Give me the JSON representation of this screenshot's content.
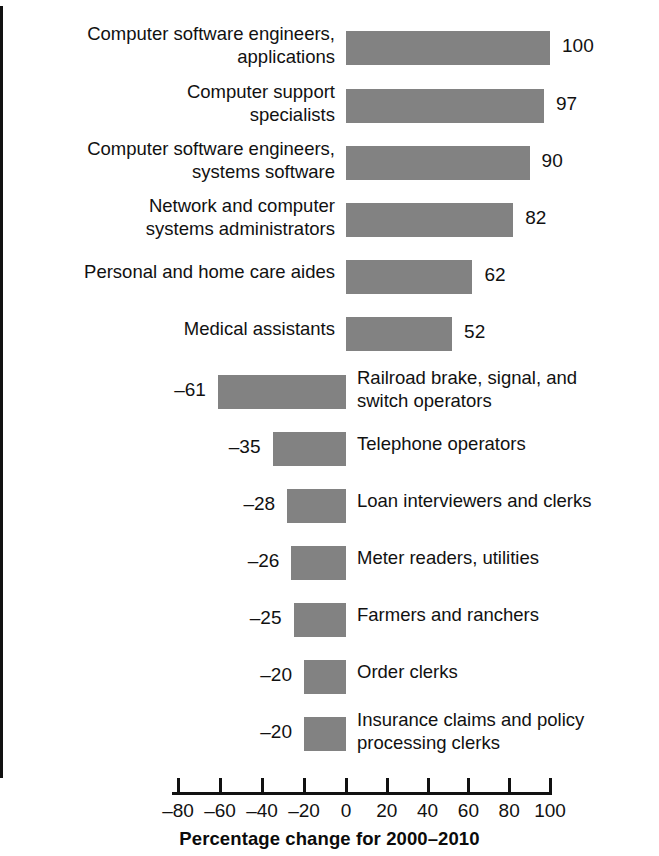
{
  "chart_data": {
    "type": "bar",
    "orientation": "horizontal",
    "title": "",
    "xlabel": "Percentage change for 2000–2010",
    "ylabel": "",
    "xlim": [
      -80,
      100
    ],
    "grid": false,
    "legend": "none",
    "tick_labels": [
      "–80",
      "–60",
      "–40",
      "–20",
      "0",
      "20",
      "40",
      "60",
      "80",
      "100"
    ],
    "tick_values": [
      -80,
      -60,
      -40,
      -20,
      0,
      20,
      40,
      60,
      80,
      100
    ],
    "bar_color": "#828282",
    "axis_color": "#111111",
    "categories": [
      "Computer software engineers,\napplications",
      "Computer support\nspecialists",
      "Computer software engineers,\nsystems software",
      "Network and computer\nsystems administrators",
      "Personal and home care aides",
      "Medical assistants",
      "Railroad brake, signal, and\nswitch operators",
      "Telephone operators",
      "Loan interviewers and clerks",
      "Meter readers, utilities",
      "Farmers and ranchers",
      "Order clerks",
      "Insurance claims and policy\nprocessing clerks"
    ],
    "values": [
      100,
      97,
      90,
      82,
      62,
      52,
      -61,
      -35,
      -28,
      -26,
      -25,
      -20,
      -20
    ],
    "value_labels": [
      "100",
      "97",
      "90",
      "82",
      "62",
      "52",
      "–61",
      "–35",
      "–28",
      "–26",
      "–25",
      "–20",
      "–20"
    ]
  },
  "rows": [
    {
      "label": "Computer software engineers,\napplications",
      "value": 100,
      "value_label": "100",
      "side": "positive",
      "label_top": 22,
      "bar_top": 31,
      "value_top": 35
    },
    {
      "label": "Computer support\nspecialists",
      "value": 97,
      "value_label": "97",
      "side": "positive",
      "label_top": 80,
      "bar_top": 89,
      "value_top": 93
    },
    {
      "label": "Computer software engineers,\nsystems software",
      "value": 90,
      "value_label": "90",
      "side": "positive",
      "label_top": 137,
      "bar_top": 146,
      "value_top": 150
    },
    {
      "label": "Network and computer\nsystems administrators",
      "value": 82,
      "value_label": "82",
      "side": "positive",
      "label_top": 194,
      "bar_top": 203,
      "value_top": 207
    },
    {
      "label": "Personal and home care aides",
      "value": 62,
      "value_label": "62",
      "side": "positive",
      "label_top": 260,
      "bar_top": 260,
      "value_top": 264
    },
    {
      "label": "Medical assistants",
      "value": 52,
      "value_label": "52",
      "side": "positive",
      "label_top": 317,
      "bar_top": 317,
      "value_top": 321
    },
    {
      "label": "Railroad brake, signal, and\nswitch operators",
      "value": -61,
      "value_label": "–61",
      "side": "negative",
      "label_top": 366,
      "bar_top": 375,
      "value_top": 379
    },
    {
      "label": "Telephone operators",
      "value": -35,
      "value_label": "–35",
      "side": "negative",
      "label_top": 432,
      "bar_top": 432,
      "value_top": 436
    },
    {
      "label": "Loan interviewers and clerks",
      "value": -28,
      "value_label": "–28",
      "side": "negative",
      "label_top": 489,
      "bar_top": 489,
      "value_top": 493
    },
    {
      "label": "Meter readers, utilities",
      "value": -26,
      "value_label": "–26",
      "side": "negative",
      "label_top": 546,
      "bar_top": 546,
      "value_top": 550
    },
    {
      "label": "Farmers and ranchers",
      "value": -25,
      "value_label": "–25",
      "side": "negative",
      "label_top": 603,
      "bar_top": 603,
      "value_top": 607
    },
    {
      "label": "Order clerks",
      "value": -20,
      "value_label": "–20",
      "side": "negative",
      "label_top": 660,
      "bar_top": 660,
      "value_top": 664
    },
    {
      "label": "Insurance claims and policy\nprocessing clerks",
      "value": -20,
      "value_label": "–20",
      "side": "negative",
      "label_top": 708,
      "bar_top": 717,
      "value_top": 721
    }
  ]
}
